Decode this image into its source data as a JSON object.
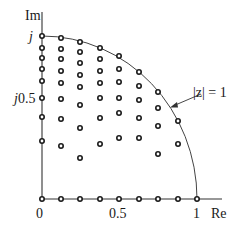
{
  "labels": {
    "im_axis": "Im",
    "re_axis": "Re",
    "j": "j",
    "j_half_prefix": "j",
    "j_half_value": "0.5",
    "x_zero": "0",
    "x_half": "0.5",
    "x_one": "1",
    "circle": "|z| = 1"
  },
  "colors": {
    "ink": "#1a1a1a",
    "axis": "#333333",
    "background": "#ffffff"
  },
  "geometry": {
    "origin_px": [
      42,
      199
    ],
    "unit_px": 155
  },
  "points": [
    [
      42,
      199
    ],
    [
      61,
      199
    ],
    [
      80,
      199
    ],
    [
      100,
      199
    ],
    [
      119,
      199
    ],
    [
      139,
      199
    ],
    [
      158,
      199
    ],
    [
      178,
      199
    ],
    [
      197,
      199
    ],
    [
      42,
      36
    ],
    [
      42,
      48
    ],
    [
      42,
      58
    ],
    [
      42,
      69
    ],
    [
      42,
      81
    ],
    [
      42,
      98
    ],
    [
      42,
      117
    ],
    [
      42,
      141
    ],
    [
      61,
      38
    ],
    [
      61,
      49
    ],
    [
      61,
      59
    ],
    [
      61,
      71
    ],
    [
      61,
      83
    ],
    [
      61,
      99
    ],
    [
      61,
      119
    ],
    [
      61,
      146
    ],
    [
      80,
      42
    ],
    [
      80,
      52
    ],
    [
      80,
      63
    ],
    [
      80,
      75
    ],
    [
      80,
      87
    ],
    [
      80,
      105
    ],
    [
      80,
      128
    ],
    [
      80,
      158
    ],
    [
      100,
      48
    ],
    [
      100,
      59
    ],
    [
      100,
      71
    ],
    [
      100,
      83
    ],
    [
      100,
      98
    ],
    [
      100,
      118
    ],
    [
      100,
      144
    ],
    [
      119,
      56
    ],
    [
      119,
      69
    ],
    [
      119,
      82
    ],
    [
      119,
      98
    ],
    [
      119,
      113
    ],
    [
      119,
      138
    ],
    [
      139,
      72
    ],
    [
      139,
      86
    ],
    [
      139,
      100
    ],
    [
      139,
      118
    ],
    [
      139,
      138
    ],
    [
      158,
      92
    ],
    [
      158,
      108
    ],
    [
      158,
      126
    ],
    [
      158,
      154
    ],
    [
      178,
      121
    ],
    [
      178,
      144
    ]
  ]
}
